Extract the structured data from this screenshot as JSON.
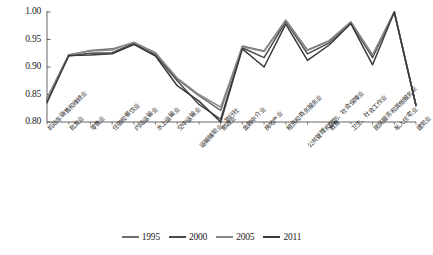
{
  "chart_data": {
    "type": "line",
    "title": "",
    "xlabel": "",
    "ylabel": "",
    "ylim": [
      0.8,
      1.0
    ],
    "yticks": [
      "0.80",
      "0.85",
      "0.90",
      "0.95",
      "1.00"
    ],
    "ytick_values": [
      0.8,
      0.85,
      0.9,
      0.95,
      1.0
    ],
    "grid": false,
    "legend_position": "bottom-center",
    "categories": [
      "机动车销售和维修业",
      "批发业",
      "零售业",
      "住宿和餐饮业",
      "内陆运输业",
      "水上运输业",
      "空中运输业",
      "运输辅助业、旅行社",
      "邮政业",
      "金融中介业",
      "房地产业",
      "租赁和商务服务业",
      "公共管理和国防、社会保障业",
      "教育",
      "卫生、社会工作业",
      "居民服务和其他服务业",
      "私人住宅业",
      "建筑业"
    ],
    "series": [
      {
        "name": "1995",
        "color": "#6f6f6f",
        "values": [
          0.843,
          0.922,
          0.93,
          0.933,
          0.944,
          0.926,
          0.878,
          0.848,
          0.821,
          0.938,
          0.929,
          0.985,
          0.931,
          0.948,
          0.982,
          0.922,
          1.0,
          0.83
        ]
      },
      {
        "name": "2000",
        "color": "#4a4a4a",
        "values": [
          0.838,
          0.92,
          0.925,
          0.926,
          0.943,
          0.922,
          0.875,
          0.832,
          0.805,
          0.935,
          0.917,
          0.983,
          0.924,
          0.944,
          0.98,
          0.917,
          1.0,
          0.83
        ]
      },
      {
        "name": "2005",
        "color": "#8a8a8a",
        "values": [
          0.841,
          0.922,
          0.929,
          0.931,
          0.945,
          0.925,
          0.88,
          0.85,
          0.827,
          0.937,
          0.928,
          0.985,
          0.93,
          0.947,
          0.981,
          0.921,
          1.0,
          0.83
        ]
      },
      {
        "name": "2011",
        "color": "#3a3a3a",
        "values": [
          0.835,
          0.921,
          0.922,
          0.924,
          0.941,
          0.92,
          0.866,
          0.838,
          0.8,
          0.933,
          0.9,
          0.978,
          0.912,
          0.94,
          0.979,
          0.904,
          1.0,
          0.83
        ]
      }
    ]
  },
  "axis": {
    "y_ticks": [
      "1.00",
      "0.95",
      "0.90",
      "0.85",
      "0.80"
    ]
  },
  "legend": {
    "items": [
      {
        "label": "1995",
        "color": "#6f6f6f"
      },
      {
        "label": "2000",
        "color": "#4a4a4a"
      },
      {
        "label": "2005",
        "color": "#8a8a8a"
      },
      {
        "label": "2011",
        "color": "#3a3a3a"
      }
    ]
  }
}
